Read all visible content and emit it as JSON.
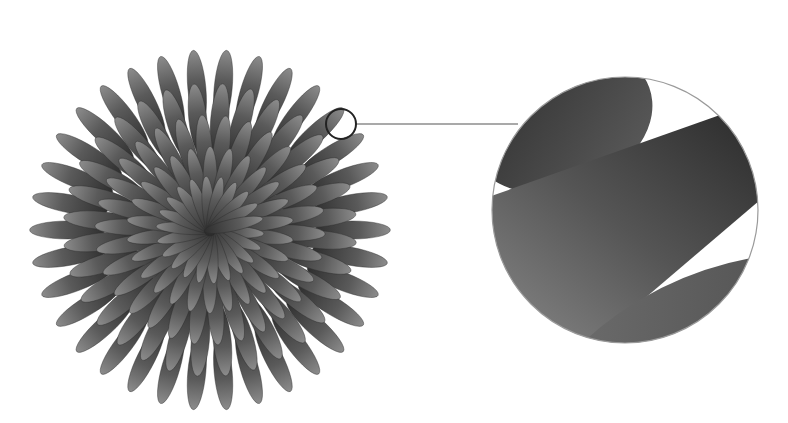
{
  "illustration": {
    "subject": "radial-petal-flower",
    "background": "#ffffff",
    "flower": {
      "cx": 210,
      "cy": 230,
      "rings": [
        {
          "count": 34,
          "rx": 38,
          "ry": 9,
          "dist": 150,
          "offset": 0
        },
        {
          "count": 32,
          "rx": 36,
          "ry": 9,
          "dist": 118,
          "offset": 5
        },
        {
          "count": 30,
          "rx": 34,
          "ry": 8,
          "dist": 88,
          "offset": 2
        },
        {
          "count": 26,
          "rx": 32,
          "ry": 7,
          "dist": 58,
          "offset": 7
        },
        {
          "count": 22,
          "rx": 30,
          "ry": 6,
          "dist": 30,
          "offset": 4
        }
      ],
      "dark": "#3a3a3a",
      "light": "#8a8a8a"
    },
    "magnifier_small": {
      "cx": 341,
      "cy": 124,
      "r": 15,
      "stroke": "#222222"
    },
    "connector_line": {
      "x1": 356,
      "y1": 124,
      "x2": 518,
      "y2": 124,
      "stroke": "#555555"
    },
    "magnifier_large": {
      "cx": 625,
      "cy": 210,
      "r": 133,
      "stroke": "#9a9a9a"
    }
  }
}
